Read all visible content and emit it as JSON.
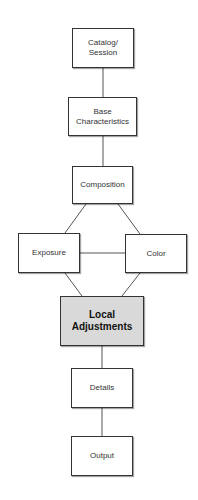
{
  "diagram": {
    "type": "flowchart",
    "nodes": [
      {
        "id": "catalog",
        "label": "Catalog/\nSession",
        "x": 72,
        "y": 28,
        "w": 62,
        "h": 40,
        "highlight": false
      },
      {
        "id": "base",
        "label": "Base\nCharacteristics",
        "x": 68,
        "y": 97,
        "w": 69,
        "h": 39,
        "highlight": false
      },
      {
        "id": "composition",
        "label": "Composition",
        "x": 72,
        "y": 166,
        "w": 61,
        "h": 38,
        "highlight": false
      },
      {
        "id": "exposure",
        "label": "Exposure",
        "x": 18,
        "y": 233,
        "w": 62,
        "h": 40,
        "highlight": false
      },
      {
        "id": "color",
        "label": "Color",
        "x": 125,
        "y": 234,
        "w": 62,
        "h": 39,
        "highlight": false
      },
      {
        "id": "local",
        "label": "Local\nAdjustments",
        "x": 60,
        "y": 296,
        "w": 84,
        "h": 50,
        "highlight": true
      },
      {
        "id": "details",
        "label": "Details",
        "x": 71,
        "y": 368,
        "w": 62,
        "h": 40,
        "highlight": false
      },
      {
        "id": "output",
        "label": "Output",
        "x": 71,
        "y": 436,
        "w": 62,
        "h": 40,
        "highlight": false
      }
    ],
    "edges": [
      {
        "from": "catalog",
        "to": "base"
      },
      {
        "from": "base",
        "to": "composition"
      },
      {
        "from": "composition",
        "to": "exposure"
      },
      {
        "from": "composition",
        "to": "color"
      },
      {
        "from": "exposure",
        "to": "color"
      },
      {
        "from": "exposure",
        "to": "local"
      },
      {
        "from": "color",
        "to": "local"
      },
      {
        "from": "local",
        "to": "details"
      },
      {
        "from": "details",
        "to": "output"
      }
    ],
    "colors": {
      "border": "#333333",
      "line": "#555555",
      "highlight_fill": "#d9d9d9",
      "fill": "#ffffff"
    }
  }
}
